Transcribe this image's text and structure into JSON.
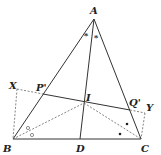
{
  "figure": {
    "type": "geometry-diagram",
    "points": {
      "A": {
        "label": "A",
        "x": 94,
        "y": 19
      },
      "B": {
        "label": "B",
        "x": 13,
        "y": 139
      },
      "C": {
        "label": "C",
        "x": 141,
        "y": 139
      },
      "D": {
        "label": "D",
        "x": 80,
        "y": 139
      },
      "I": {
        "label": "I",
        "x": 84,
        "y": 103
      },
      "P": {
        "label": "P'",
        "x": 43,
        "y": 94
      },
      "Q": {
        "label": "Q'",
        "x": 130,
        "y": 110
      },
      "X": {
        "label": "X",
        "x": 17,
        "y": 89
      },
      "Y": {
        "label": "Y",
        "x": 145,
        "y": 113
      }
    },
    "angle_marks": {
      "A": "*",
      "B": "○",
      "C": "•"
    }
  }
}
